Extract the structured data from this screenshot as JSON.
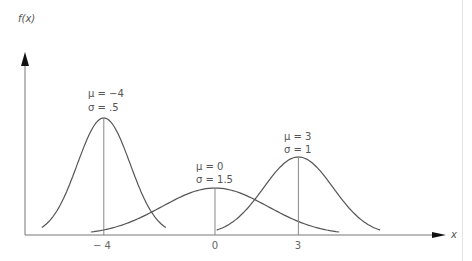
{
  "chart_data": {
    "type": "line",
    "title": "",
    "xlabel": "x",
    "ylabel": "f(x)",
    "grid": false,
    "legend": "none",
    "x_ticks": [
      "-4",
      "0",
      "3"
    ],
    "series": [
      {
        "name": "μ = -4, σ = .5",
        "mu": -4,
        "sigma": 0.5,
        "label_line1": "μ = −4",
        "label_line2": "σ = .5"
      },
      {
        "name": "μ = 0, σ = 1.5",
        "mu": 0,
        "sigma": 1.5,
        "label_line1": "μ = 0",
        "label_line2": "σ = 1.5"
      },
      {
        "name": "μ = 3, σ = 1",
        "mu": 3,
        "sigma": 1,
        "label_line1": "μ = 3",
        "label_line2": "σ = 1"
      }
    ]
  },
  "axes": {
    "y_label": "f(x)",
    "x_label": "x"
  },
  "ticks": {
    "t0": "− 4",
    "t1": "0",
    "t2": "3"
  },
  "colors": {
    "curve": "#555555",
    "axis": "#777777"
  }
}
